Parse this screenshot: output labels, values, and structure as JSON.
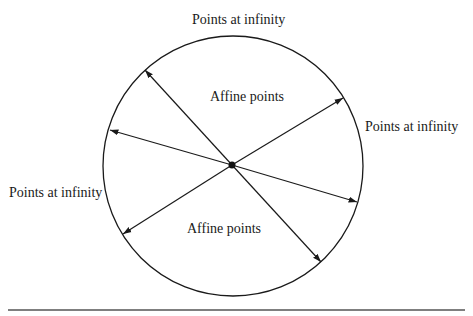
{
  "diagram": {
    "labels": {
      "top": "Points at infinity",
      "right": "Points at infinity",
      "left": "Points at infinity",
      "affine_upper": "Affine points",
      "affine_lower": "Affine points"
    },
    "circle": {
      "cx": 233,
      "cy": 166,
      "r": 130,
      "stroke": "#1a1a1a"
    },
    "center_point": {
      "x": 232,
      "y": 165
    },
    "arrows": [
      {
        "from": [
          232,
          165
        ],
        "to": [
          145,
          70
        ]
      },
      {
        "from": [
          232,
          165
        ],
        "to": [
          110,
          130
        ]
      },
      {
        "from": [
          232,
          165
        ],
        "to": [
          343,
          98
        ]
      },
      {
        "from": [
          232,
          165
        ],
        "to": [
          123,
          234
        ]
      },
      {
        "from": [
          232,
          165
        ],
        "to": [
          321,
          262
        ]
      },
      {
        "from": [
          232,
          165
        ],
        "to": [
          357,
          202
        ]
      }
    ],
    "rule": {
      "x1": 8,
      "x2": 465,
      "y": 310,
      "color": "#555555"
    }
  }
}
